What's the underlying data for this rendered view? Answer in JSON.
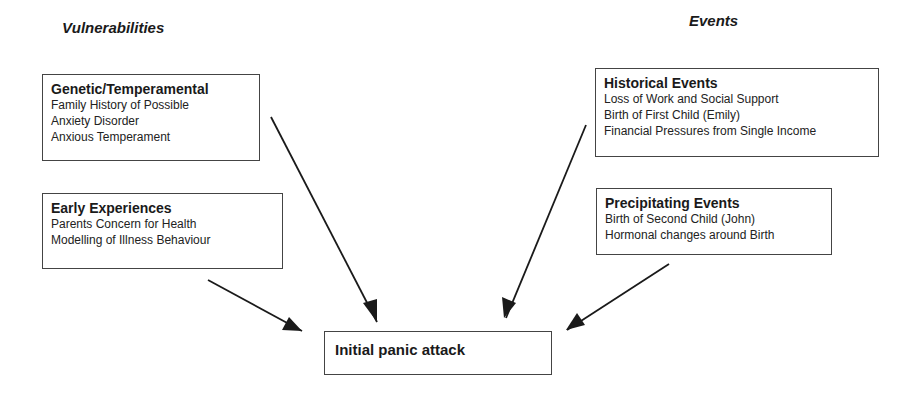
{
  "headings": {
    "vulnerabilities": "Vulnerabilities",
    "events": "Events"
  },
  "boxes": {
    "genetic": {
      "title": "Genetic/Temperamental",
      "lines": [
        "Family History of Possible",
        "Anxiety Disorder",
        "Anxious Temperament"
      ]
    },
    "early": {
      "title": "Early Experiences",
      "lines": [
        "Parents Concern for Health",
        "Modelling of Illness Behaviour"
      ]
    },
    "historical": {
      "title": "Historical Events",
      "lines": [
        "Loss of Work and Social Support",
        "Birth of First Child (Emily)",
        "Financial Pressures from Single Income"
      ]
    },
    "precipitating": {
      "title": "Precipitating Events",
      "lines": [
        "Birth of Second Child (John)",
        "Hormonal changes around Birth"
      ]
    },
    "central": {
      "title": "Initial panic attack"
    }
  },
  "arrows": [
    {
      "from": "genetic",
      "to": "central"
    },
    {
      "from": "early",
      "to": "central"
    },
    {
      "from": "historical",
      "to": "central"
    },
    {
      "from": "precipitating",
      "to": "central"
    }
  ],
  "colors": {
    "line": "#1a1a1a",
    "border": "#444444",
    "background": "#ffffff"
  }
}
